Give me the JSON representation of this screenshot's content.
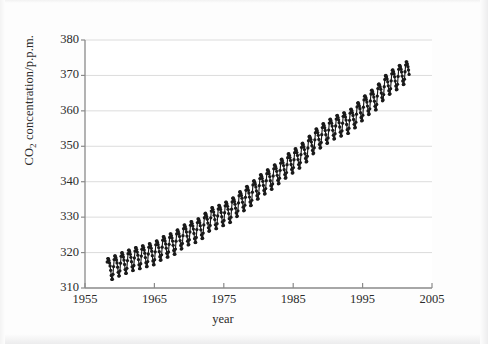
{
  "figure": {
    "background_color": "#fdfdfd",
    "plot_background_color": "#ffffff",
    "grid_color": "#d8d8d8",
    "axis_color": "#8a8a8a",
    "series_color": "#1a1a1a"
  },
  "axes": {
    "ylabel_text": "CO",
    "ylabel_sub": "2",
    "ylabel_rest": " concentration/p.p.m.",
    "xlabel": "year",
    "yticks": [
      "310",
      "320",
      "330",
      "340",
      "350",
      "360",
      "370",
      "380"
    ],
    "xticks": [
      "1955",
      "1965",
      "1975",
      "1985",
      "1995",
      "2005"
    ]
  },
  "chart_data": {
    "type": "line",
    "title": "",
    "xlabel": "year",
    "ylabel": "CO2 concentration/p.p.m.",
    "xlim": [
      1955,
      2005
    ],
    "ylim": [
      310,
      380
    ],
    "xtick_step": 10,
    "ytick_step": 10,
    "grid": "horizontal",
    "legend": "none",
    "markers": "filled-circle",
    "seasonal_amplitude_ppm": 3.1,
    "annual_trend": {
      "x": [
        1958,
        1959,
        1960,
        1961,
        1962,
        1963,
        1964,
        1965,
        1966,
        1967,
        1968,
        1969,
        1970,
        1971,
        1972,
        1973,
        1974,
        1975,
        1976,
        1977,
        1978,
        1979,
        1980,
        1981,
        1982,
        1983,
        1984,
        1985,
        1986,
        1987,
        1988,
        1989,
        1990,
        1991,
        1992,
        1993,
        1994,
        1995,
        1996,
        1997,
        1998,
        1999,
        2000,
        2001
      ],
      "y": [
        315.3,
        315.9,
        316.9,
        317.6,
        318.4,
        318.9,
        319.5,
        320.0,
        321.4,
        322.2,
        323.0,
        324.6,
        325.7,
        326.3,
        327.5,
        329.7,
        330.2,
        331.1,
        332.0,
        333.8,
        335.4,
        336.8,
        338.7,
        340.1,
        341.4,
        343.0,
        344.6,
        346.0,
        347.4,
        349.2,
        351.6,
        353.1,
        354.4,
        355.6,
        356.4,
        357.1,
        358.8,
        360.8,
        362.6,
        363.8,
        366.6,
        368.3,
        369.5,
        371.0
      ]
    }
  }
}
